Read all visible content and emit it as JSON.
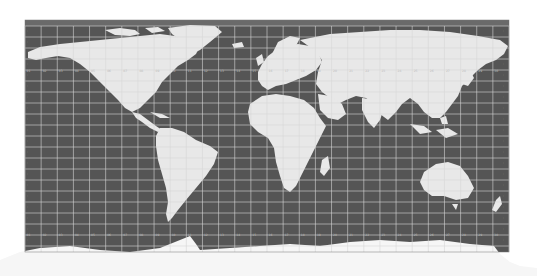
{
  "map": {
    "projection": "equirectangular",
    "colors": {
      "background": "#ffffff",
      "ocean": "#555555",
      "land": "#e6e6e6",
      "land_highlight": "#f4f4f4",
      "antarctica": "#f6f6f6",
      "grid": "#d8d8d8",
      "label": "#bdbdbd"
    },
    "frame": {
      "x": 25,
      "y": 20,
      "width": 484,
      "height": 230
    },
    "grid": {
      "columns": 60,
      "rows": 20,
      "label_rows_y": [
        72,
        236
      ],
      "label_col_x": [
        29,
        505
      ]
    },
    "top_band": {
      "y": 20,
      "height": 6
    }
  }
}
